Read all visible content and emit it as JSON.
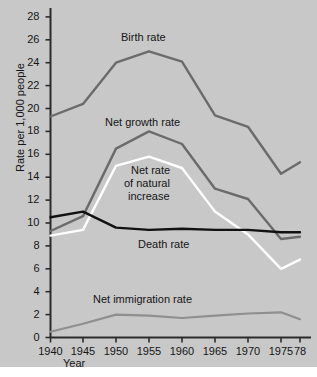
{
  "chart_data": {
    "type": "line",
    "title": "",
    "xlabel": "Year",
    "ylabel": "Rate per 1,000 people",
    "x": [
      1940,
      1945,
      1950,
      1955,
      1960,
      1965,
      1970,
      1975,
      1978
    ],
    "xtick_labels": [
      "1940",
      "1945",
      "1950",
      "1955",
      "1960",
      "1965",
      "1970",
      "1975",
      "78"
    ],
    "ytick_labels": [
      "0",
      "2",
      "4",
      "6",
      "8",
      "10",
      "12",
      "14",
      "16",
      "18",
      "20",
      "22",
      "24",
      "26",
      "28"
    ],
    "ytick_values": [
      0,
      2,
      4,
      6,
      8,
      10,
      12,
      14,
      16,
      18,
      20,
      22,
      24,
      26,
      28
    ],
    "xlim": [
      1940,
      1978
    ],
    "ylim": [
      0,
      29.2
    ],
    "grid": false,
    "legend": "inline-annotations",
    "series": [
      {
        "name": "Birth rate",
        "color": "#6b6b6b",
        "width": 2.4,
        "values": [
          19.3,
          20.4,
          24.0,
          25.0,
          24.1,
          19.4,
          18.4,
          14.3,
          15.3
        ],
        "label": "Birth rate"
      },
      {
        "name": "Net growth rate",
        "color": "#6b6b6b",
        "width": 2.4,
        "values": [
          9.3,
          10.6,
          16.5,
          18.0,
          16.9,
          13.0,
          12.1,
          8.6,
          8.8
        ],
        "label": "Net growth rate"
      },
      {
        "name": "Net rate of natural increase",
        "color": "#ffffff",
        "width": 2.4,
        "values": [
          8.9,
          9.4,
          15.0,
          15.8,
          14.8,
          11.0,
          9.0,
          6.0,
          6.8
        ],
        "label": "Net rate of natural increase"
      },
      {
        "name": "Death rate",
        "color": "#111111",
        "width": 2.4,
        "values": [
          10.5,
          11.0,
          9.6,
          9.4,
          9.5,
          9.4,
          9.4,
          9.2,
          9.2
        ],
        "label": "Death rate"
      },
      {
        "name": "Net immigration rate",
        "color": "#8f8f8f",
        "width": 2.2,
        "values": [
          0.5,
          1.2,
          2.0,
          1.9,
          1.7,
          1.9,
          2.1,
          2.2,
          1.6
        ],
        "label": "Net immigration rate"
      }
    ],
    "annotations": [
      {
        "text": "Birth rate",
        "series": "Birth rate"
      },
      {
        "text": "Net growth rate",
        "series": "Net growth rate"
      },
      {
        "text": "Net rate",
        "series": "Net rate of natural increase"
      },
      {
        "text": "of natural",
        "series": "Net rate of natural increase"
      },
      {
        "text": "increase",
        "series": "Net rate of natural increase"
      },
      {
        "text": "Death rate",
        "series": "Death rate"
      },
      {
        "text": "Net immigration rate",
        "series": "Net immigration rate"
      }
    ]
  },
  "labels": {
    "y_axis_title": "Rate per 1,000 people",
    "x_axis_title": "Year",
    "birth_rate": "Birth rate",
    "net_growth_rate": "Net growth rate",
    "natural_increase_l1": "Net rate",
    "natural_increase_l2": "of natural",
    "natural_increase_l3": "increase",
    "death_rate": "Death rate",
    "net_immigration_rate": "Net immigration rate"
  },
  "ticks": {
    "y": [
      "28",
      "26",
      "24",
      "22",
      "20",
      "18",
      "16",
      "14",
      "12",
      "10",
      "8",
      "6",
      "4",
      "2",
      "0"
    ],
    "x": [
      "1940",
      "1945",
      "1950",
      "1955",
      "1960",
      "1965",
      "1970",
      "1975",
      "78"
    ]
  },
  "colors": {
    "background": "#c8c8c8",
    "axis": "#2b2b2b",
    "birth_rate": "#6b6b6b",
    "net_growth_rate": "#6b6b6b",
    "natural_increase": "#ffffff",
    "death_rate": "#111111",
    "net_immigration_rate": "#8f8f8f"
  }
}
